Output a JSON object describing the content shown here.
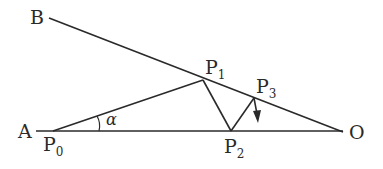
{
  "diagram": {
    "type": "geometry-reflection",
    "line_color": "#2a2a2a",
    "labels": {
      "B": "B",
      "A": "A",
      "O": "O",
      "P0": {
        "main": "P",
        "sub": "0"
      },
      "P1": {
        "main": "P",
        "sub": "1"
      },
      "P2": {
        "main": "P",
        "sub": "2"
      },
      "P3": {
        "main": "P",
        "sub": "3"
      },
      "angle": "α"
    },
    "points": {
      "B_end": [
        49,
        18
      ],
      "A_end": [
        36,
        131
      ],
      "P0": [
        53,
        131
      ],
      "P1": [
        203,
        79
      ],
      "P2": [
        231,
        131
      ],
      "P3": [
        254,
        98
      ],
      "O": [
        343,
        132
      ],
      "arrow_tip": [
        257,
        121
      ]
    },
    "segments": [
      [
        "B_end",
        "O"
      ],
      [
        "A_end",
        "O"
      ],
      [
        "P0",
        "P1"
      ],
      [
        "P1",
        "P2"
      ],
      [
        "P2",
        "P3"
      ]
    ]
  }
}
